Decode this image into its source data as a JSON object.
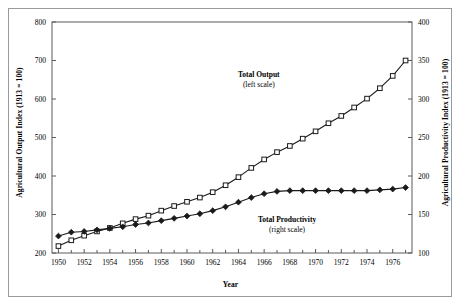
{
  "chart_data": {
    "type": "line",
    "title": "",
    "xlabel": "Year",
    "ylabel": "Agricultural Output Index (1913 = 100)",
    "ylabel_right": "Agricultural Productivity Index (1913 = 100)",
    "grid": false,
    "legend_position": "inline-annotations",
    "xlim": [
      1949.5,
      1977.5
    ],
    "ylim": [
      200,
      800
    ],
    "ylim_right": [
      100,
      400
    ],
    "xticks": [
      1950,
      1952,
      1954,
      1956,
      1958,
      1960,
      1962,
      1964,
      1966,
      1968,
      1970,
      1972,
      1974,
      1976
    ],
    "xtick_labels": [
      "1950",
      "1952",
      "1954",
      "1956",
      "1958",
      "1960",
      "1962",
      "1964",
      "1966",
      "1968",
      "1970",
      "1972",
      "1974",
      "1976"
    ],
    "xticks_minor": [
      1951,
      1953,
      1955,
      1957,
      1959,
      1961,
      1963,
      1965,
      1967,
      1969,
      1971,
      1973,
      1975,
      1977
    ],
    "yticks": [
      200,
      300,
      400,
      500,
      600,
      700,
      800
    ],
    "ytick_labels": [
      "200",
      "300",
      "400",
      "500",
      "600",
      "700",
      "800"
    ],
    "yticks_right": [
      100,
      150,
      200,
      250,
      300,
      350,
      400
    ],
    "ytick_labels_right": [
      "100",
      "150",
      "200",
      "250",
      "300",
      "350",
      "400"
    ],
    "x": [
      1950,
      1951,
      1952,
      1953,
      1954,
      1955,
      1956,
      1957,
      1958,
      1959,
      1960,
      1961,
      1962,
      1963,
      1964,
      1965,
      1966,
      1967,
      1968,
      1969,
      1970,
      1971,
      1972,
      1973,
      1974,
      1975,
      1976,
      1977
    ],
    "series": [
      {
        "name": "Total Output",
        "axis": "left",
        "marker": "square-open",
        "annotation_line1": "Total Output",
        "annotation_line2": "(left scale)",
        "values": [
          218,
          233,
          245,
          256,
          265,
          277,
          288,
          297,
          310,
          322,
          333,
          344,
          358,
          376,
          397,
          421,
          443,
          462,
          478,
          497,
          516,
          537,
          556,
          578,
          601,
          628,
          660,
          700
        ]
      },
      {
        "name": "Total Productivity",
        "axis": "right",
        "marker": "diamond-filled",
        "annotation_line1": "Total Productivity",
        "annotation_line2": "(right scale)",
        "values": [
          122,
          127,
          128,
          130,
          132,
          134,
          137,
          139,
          142,
          145,
          148,
          151,
          155,
          160,
          166,
          172,
          177,
          180,
          181,
          181,
          181,
          181,
          181,
          181,
          181,
          182,
          183,
          185
        ]
      }
    ]
  },
  "annotations": {
    "output": {
      "line1": "Total Output",
      "line2": "(left scale)"
    },
    "productivity": {
      "line1": "Total Productivity",
      "line2": "(right scale)"
    }
  },
  "axes": {
    "left_title": "Agricultural Output Index (1913 = 100)",
    "right_title": "Agricultural Productivity Index (1913 = 100)",
    "bottom_title": "Year"
  },
  "colors": {
    "line": "#1a1a1a",
    "frame": "#5a5a5a",
    "outer_frame": "#9a9a9a",
    "background": "#ffffff",
    "marker_fill_open": "#ffffff",
    "marker_fill_solid": "#1a1a1a"
  }
}
